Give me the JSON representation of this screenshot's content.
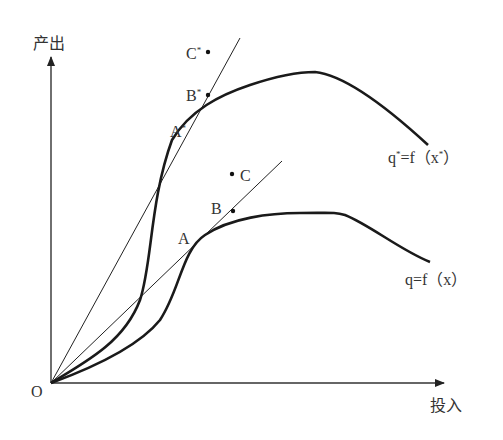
{
  "diagram": {
    "y_axis_label": "产出",
    "x_axis_label": "投入",
    "origin_label": "O",
    "curves": [
      {
        "name": "upper",
        "label": "q",
        "label_sup": "*",
        "label_rest": "=f（x",
        "label_sup2": "*",
        "label_end": "）"
      },
      {
        "name": "lower",
        "label": "q=f（x）"
      }
    ],
    "points": {
      "A_star": {
        "label": "A",
        "sup": "*"
      },
      "B_star": {
        "label": "B",
        "sup": "*"
      },
      "C_star": {
        "label": "C",
        "sup": "*"
      },
      "A": {
        "label": "A"
      },
      "B": {
        "label": "B"
      },
      "C": {
        "label": "C"
      }
    },
    "colors": {
      "line": "#1a1a1a",
      "background": "#ffffff"
    }
  }
}
